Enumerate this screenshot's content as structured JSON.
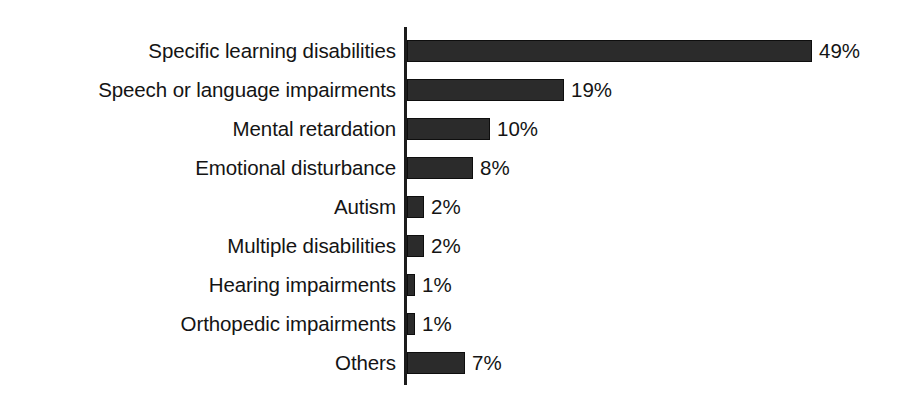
{
  "chart_data": {
    "type": "bar",
    "orientation": "horizontal",
    "title": "",
    "subtitle": "",
    "xlabel": "",
    "ylabel": "",
    "xlim": [
      0,
      49
    ],
    "grid": false,
    "legend": false,
    "value_suffix": "%",
    "bar_color": "#2b2b2b",
    "background_color": "#ffffff",
    "axis_color": "#1c1c1c",
    "categories": [
      "Specific learning disabilities",
      "Speech or language impairments",
      "Mental retardation",
      "Emotional disturbance",
      "Autism",
      "Multiple disabilities",
      "Hearing impairments",
      "Orthopedic impairments",
      "Others"
    ],
    "values": [
      49,
      19,
      10,
      8,
      2,
      2,
      1,
      1,
      7
    ],
    "value_labels": [
      "49%",
      "19%",
      "10%",
      "8%",
      "2%",
      "2%",
      "1%",
      "1%",
      "7%"
    ]
  }
}
